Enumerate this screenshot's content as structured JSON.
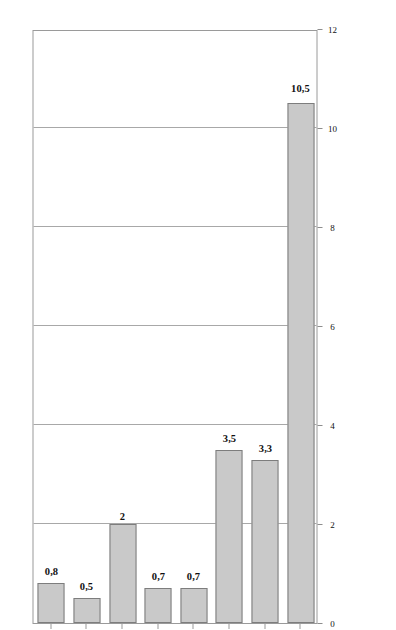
{
  "chart_data": {
    "type": "bar",
    "orientation": "horizontal",
    "title": "",
    "subtitle": "",
    "xlabel": "",
    "ylabel": "",
    "categories": [
      "Welt (Liquids)",
      "OPEC",
      "Russland",
      "Biokraftstoffe",
      "Ölsand",
      "NGL (Welt)",
      "Refinery Gain",
      "Sonstiges"
    ],
    "values": [
      10.5,
      3.3,
      3.5,
      0.7,
      0.7,
      2,
      0.5,
      0.8
    ],
    "value_labels": [
      "10,5",
      "3,3",
      "3,5",
      "0,7",
      "0,7",
      "2",
      "0,5",
      "0,8"
    ],
    "xlim": [
      0,
      12
    ],
    "ticks": [
      0,
      2,
      4,
      6,
      8,
      10,
      12
    ],
    "tick_labels": [
      "0",
      "2",
      "4",
      "6",
      "8",
      "10",
      "12"
    ],
    "grid": true,
    "legend": false,
    "legend_position": "none",
    "bar_color": "#c9c9c9",
    "bar_border_color": "#7d7d7d",
    "axis_color": "#9a9a9a",
    "grid_color": "#a8a8a8"
  },
  "footer": {
    "source_note": "Quelle: EIA, eig. Ber., OPEC und Russland ohne NGL, Biokraftstoffe in Benzinäquivalenten."
  }
}
